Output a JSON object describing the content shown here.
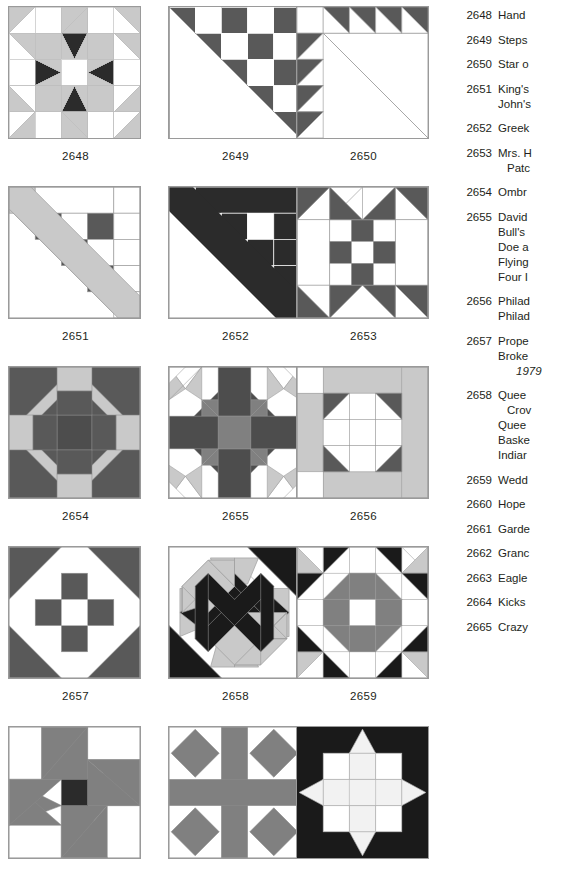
{
  "page": {
    "kind": "quilt-block-index-plate",
    "block_count": 15
  },
  "palette": {
    "white": "#ffffff",
    "light_gray": "#c9c9c9",
    "mid_gray": "#808080",
    "dark_gray": "#595959",
    "charcoal": "#4d4d4d",
    "near_black": "#1a1a1a",
    "outline": "#9a9a9a",
    "text": "#231f20"
  },
  "blocks": [
    {
      "id": "2648",
      "caption": "2648",
      "name": "block-2648"
    },
    {
      "id": "2649",
      "caption": "2649",
      "name": "block-2649"
    },
    {
      "id": "2650",
      "caption": "2650",
      "name": "block-2650"
    },
    {
      "id": "2651",
      "caption": "2651",
      "name": "block-2651"
    },
    {
      "id": "2652",
      "caption": "2652",
      "name": "block-2652"
    },
    {
      "id": "2653",
      "caption": "2653",
      "name": "block-2653"
    },
    {
      "id": "2654",
      "caption": "2654",
      "name": "block-2654"
    },
    {
      "id": "2655",
      "caption": "2655",
      "name": "block-2655"
    },
    {
      "id": "2656",
      "caption": "2656",
      "name": "block-2656"
    },
    {
      "id": "2657",
      "caption": "2657",
      "name": "block-2657"
    },
    {
      "id": "2658",
      "caption": "2658",
      "name": "block-2658"
    },
    {
      "id": "2659",
      "caption": "2659",
      "name": "block-2659"
    },
    {
      "id": "2660",
      "caption": "",
      "name": "block-2660"
    },
    {
      "id": "2661",
      "caption": "",
      "name": "block-2661"
    },
    {
      "id": "2662",
      "caption": "",
      "name": "block-2662"
    }
  ],
  "index": [
    {
      "num": "2648",
      "names": [
        {
          "text": "Hand",
          "style": "primary"
        }
      ]
    },
    {
      "num": "2649",
      "names": [
        {
          "text": "Steps",
          "style": "primary"
        }
      ]
    },
    {
      "num": "2650",
      "names": [
        {
          "text": "Star o",
          "style": "primary"
        }
      ]
    },
    {
      "num": "2651",
      "names": [
        {
          "text": "King's",
          "style": "primary"
        },
        {
          "text": "John's",
          "style": "primary"
        }
      ]
    },
    {
      "num": "2652",
      "names": [
        {
          "text": "Greek",
          "style": "primary"
        }
      ]
    },
    {
      "num": "2653",
      "names": [
        {
          "text": "Mrs. H",
          "style": "primary"
        },
        {
          "text": "Patc",
          "style": "alt"
        }
      ]
    },
    {
      "num": "2654",
      "names": [
        {
          "text": "Ombr",
          "style": "primary"
        }
      ]
    },
    {
      "num": "2655",
      "names": [
        {
          "text": "David",
          "style": "primary"
        },
        {
          "text": "Bull's",
          "style": "primary"
        },
        {
          "text": "Doe a",
          "style": "primary"
        },
        {
          "text": "Flying",
          "style": "primary"
        },
        {
          "text": "Four I",
          "style": "primary"
        }
      ]
    },
    {
      "num": "2656",
      "names": [
        {
          "text": "Philad",
          "style": "primary"
        },
        {
          "text": "Philad",
          "style": "primary"
        }
      ]
    },
    {
      "num": "2657",
      "names": [
        {
          "text": "Prope",
          "style": "primary"
        },
        {
          "text": "Broke",
          "style": "primary"
        },
        {
          "text": "1979",
          "style": "date"
        }
      ]
    },
    {
      "num": "2658",
      "names": [
        {
          "text": "Quee",
          "style": "primary"
        },
        {
          "text": "Crov",
          "style": "alt"
        },
        {
          "text": "Quee",
          "style": "primary"
        },
        {
          "text": "Baske",
          "style": "primary"
        },
        {
          "text": "Indiar",
          "style": "primary"
        }
      ]
    },
    {
      "num": "2659",
      "names": [
        {
          "text": "Wedd",
          "style": "primary"
        }
      ]
    },
    {
      "num": "2660",
      "names": [
        {
          "text": "Hope",
          "style": "primary"
        }
      ]
    },
    {
      "num": "2661",
      "names": [
        {
          "text": "Garde",
          "style": "primary"
        }
      ]
    },
    {
      "num": "2662",
      "names": [
        {
          "text": "Granc",
          "style": "primary"
        }
      ]
    },
    {
      "num": "2663",
      "names": [
        {
          "text": "Eagle",
          "style": "primary"
        }
      ]
    },
    {
      "num": "2664",
      "names": [
        {
          "text": "Kicks",
          "style": "primary"
        }
      ]
    },
    {
      "num": "2665",
      "names": [
        {
          "text": "Crazy",
          "style": "primary"
        }
      ]
    }
  ]
}
